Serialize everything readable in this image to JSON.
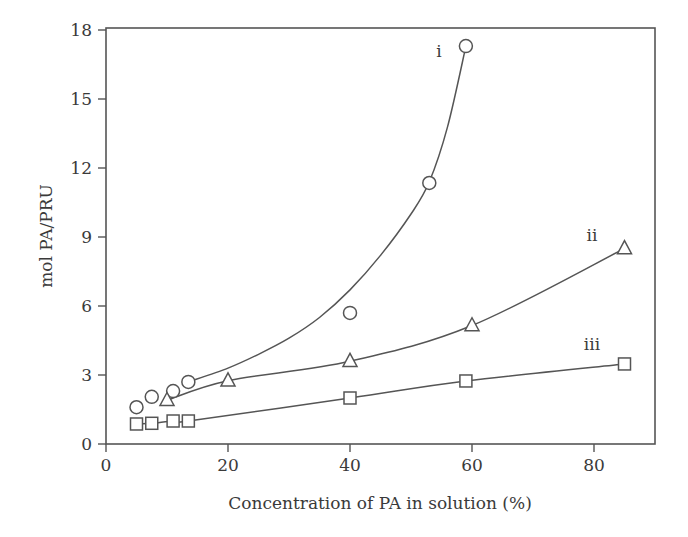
{
  "chart_data": {
    "type": "scatter",
    "title": "",
    "xlabel": "Concentration of PA in solution (%)",
    "ylabel": "mol PA/PRU",
    "xlim": [
      0,
      90
    ],
    "ylim": [
      0,
      18
    ],
    "xticks": [
      0,
      20,
      40,
      60,
      80
    ],
    "yticks": [
      0,
      3,
      6,
      9,
      12,
      15,
      18
    ],
    "grid": false,
    "legend": "inline curve labels",
    "series": [
      {
        "name": "i",
        "marker": "circle",
        "x": [
          5,
          7.5,
          11,
          13.5,
          40,
          53,
          59
        ],
        "y": [
          1.6,
          2.05,
          2.3,
          2.7,
          5.7,
          11.35,
          17.3
        ],
        "fit": "exponential curve",
        "fit_x": [
          13.5,
          20,
          25,
          30,
          35,
          40,
          45,
          50,
          53,
          56,
          59
        ],
        "fit_y": [
          2.7,
          3.3,
          3.9,
          4.6,
          5.5,
          6.7,
          8.2,
          10.0,
          11.4,
          13.8,
          17.3
        ]
      },
      {
        "name": "ii",
        "marker": "triangle",
        "x": [
          10,
          20,
          40,
          60,
          85
        ],
        "y": [
          1.9,
          2.75,
          3.6,
          5.15,
          8.5
        ],
        "fit": "line through points"
      },
      {
        "name": "iii",
        "marker": "square",
        "x": [
          5,
          7.5,
          11,
          13.5,
          40,
          59,
          85
        ],
        "y": [
          0.87,
          0.9,
          1.0,
          1.0,
          2.0,
          2.74,
          3.48
        ],
        "fit": "line through points"
      }
    ],
    "annotations": [
      {
        "text": "i",
        "x": 54.5,
        "y": 17.0
      },
      {
        "text": "ii",
        "x": 79.5,
        "y": 9.0
      },
      {
        "text": "iii",
        "x": 79.5,
        "y": 4.3
      }
    ]
  },
  "labels": {
    "x_axis": "Concentration of PA in solution (%)",
    "y_axis": "mol PA/PRU",
    "series_i": "i",
    "series_ii": "ii",
    "series_iii": "iii",
    "x_ticks": [
      "0",
      "20",
      "40",
      "60",
      "80"
    ],
    "y_ticks": [
      "0",
      "3",
      "6",
      "9",
      "12",
      "15",
      "18"
    ]
  }
}
